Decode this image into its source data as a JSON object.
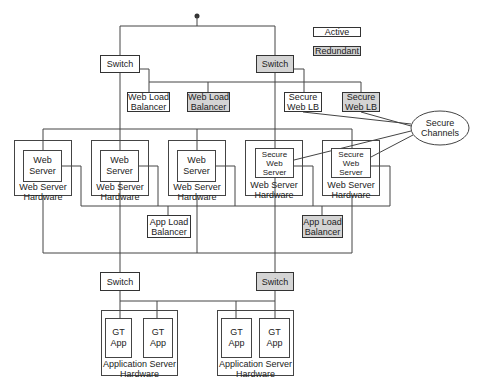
{
  "legend": {
    "active": "Active",
    "redundant": "Redundant"
  },
  "colors": {
    "active_fill": "#ffffff",
    "redundant_fill": "#d4d4d4",
    "stroke": "#444444"
  },
  "top_switches": [
    {
      "label": "Switch",
      "state": "active"
    },
    {
      "label": "Switch",
      "state": "redundant"
    }
  ],
  "load_balancers": [
    {
      "label": "Web Load\nBalancer",
      "state": "active"
    },
    {
      "label": "Web Load\nBalancer",
      "state": "redundant"
    },
    {
      "label": "Secure\nWeb LB",
      "state": "active"
    },
    {
      "label": "Secure\nWeb LB",
      "state": "redundant"
    }
  ],
  "secure_channels": "Secure\nChannels",
  "web_server_hardware": [
    {
      "server": "Web\nServer",
      "hardware": "Web Server\nHardware"
    },
    {
      "server": "Web\nServer",
      "hardware": "Web Server\nHardware"
    },
    {
      "server": "Web\nServer",
      "hardware": "Web Server\nHardware"
    },
    {
      "server": "Secure\nWeb\nServer",
      "hardware": "Web Server\nHardware"
    },
    {
      "server": "Secure\nWeb\nServer",
      "hardware": "Web Server\nHardware"
    }
  ],
  "app_load_balancers": [
    {
      "label": "App Load\nBalancer",
      "state": "active"
    },
    {
      "label": "App Load\nBalancer",
      "state": "redundant"
    }
  ],
  "bottom_switches": [
    {
      "label": "Switch",
      "state": "active"
    },
    {
      "label": "Switch",
      "state": "redundant"
    }
  ],
  "app_server_hardware": [
    {
      "apps": [
        "GT App",
        "GT App"
      ],
      "hardware": "Application Server\nHardware"
    },
    {
      "apps": [
        "GT App",
        "GT App"
      ],
      "hardware": "Application Server\nHardware"
    }
  ]
}
